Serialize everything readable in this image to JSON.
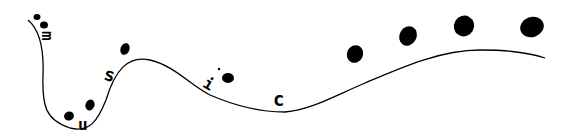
{
  "logo": {
    "word": "music",
    "letters": [
      "m",
      "u",
      "s",
      "i",
      "c"
    ],
    "ink_color": "#000000",
    "background": "#ffffff"
  }
}
